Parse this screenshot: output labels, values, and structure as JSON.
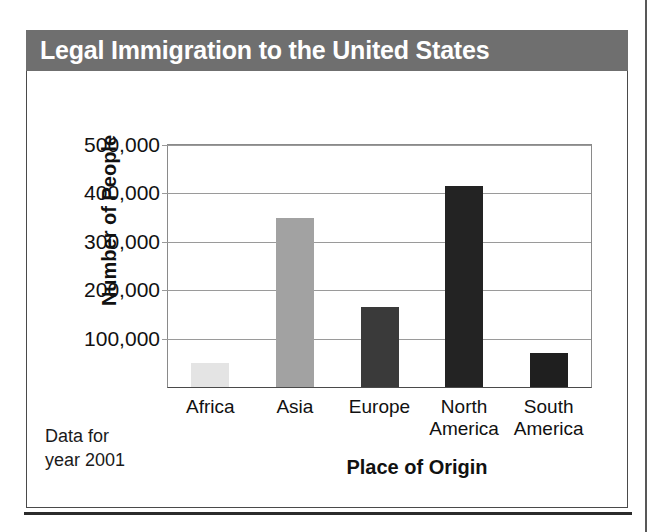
{
  "figure": {
    "title": "Legal Immigration to the United States",
    "source_note": "Data for\nyear 2001",
    "title_band_color": "#6f6f6f",
    "border_color": "#4a4a4a"
  },
  "chart_data": {
    "type": "bar",
    "title": "Legal Immigration to the United States",
    "xlabel": "Place of Origin",
    "ylabel": "Number of People",
    "categories": [
      "Africa",
      "Asia",
      "Europe",
      "North\nAmerica",
      "South\nAmerica"
    ],
    "values": [
      50000,
      350000,
      165000,
      415000,
      70000
    ],
    "value_labels": [
      "50,000",
      "350,000",
      "165,000",
      "415,000",
      "70,000"
    ],
    "bar_colors": [
      "#e4e4e4",
      "#a2a2a2",
      "#3a3a3a",
      "#232323",
      "#1f1f1f"
    ],
    "ylim": [
      0,
      500000
    ],
    "yticks": [
      100000,
      200000,
      300000,
      400000,
      500000
    ],
    "ytick_labels": [
      "100,000",
      "200,000",
      "300,000",
      "400,000",
      "500,000"
    ],
    "grid": true,
    "legend": "none",
    "annotation": "Data for year 2001"
  }
}
